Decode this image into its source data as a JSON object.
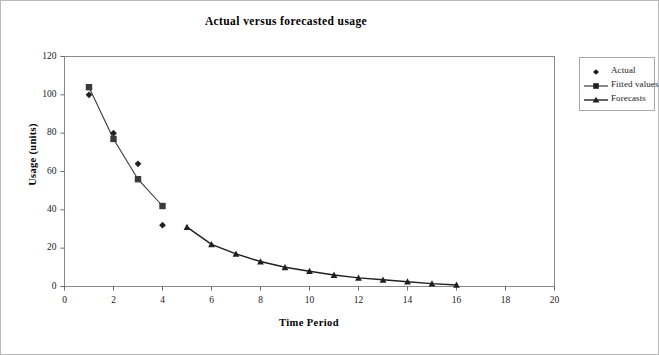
{
  "figure": {
    "border_color": "#b9b9b9",
    "background": "#ffffff"
  },
  "chart_data": {
    "type": "line",
    "title": "Actual versus forecasted usage",
    "xlabel": "Time Period",
    "ylabel": "Usage (units)",
    "xlim": [
      0,
      20
    ],
    "ylim": [
      0,
      120
    ],
    "xticks": [
      0,
      2,
      4,
      6,
      8,
      10,
      12,
      14,
      16,
      18,
      20
    ],
    "yticks": [
      0,
      20,
      40,
      60,
      80,
      100,
      120
    ],
    "grid": false,
    "legend_position": "right-outside",
    "series": [
      {
        "name": "Actual",
        "marker": "diamond",
        "line": false,
        "color": "#202020",
        "x": [
          1,
          2,
          3,
          4
        ],
        "values": [
          100,
          80,
          64,
          32
        ]
      },
      {
        "name": "Fitted values",
        "marker": "square",
        "line": true,
        "color": "#3a3a3a",
        "x": [
          1,
          2,
          3,
          4
        ],
        "values": [
          104,
          77,
          56,
          42
        ]
      },
      {
        "name": "Forecasts",
        "marker": "triangle",
        "line": true,
        "color": "#202020",
        "x": [
          5,
          6,
          7,
          8,
          9,
          10,
          11,
          12,
          13,
          14,
          15,
          16
        ],
        "values": [
          31,
          22,
          17,
          13,
          10,
          8,
          6,
          4.5,
          3.5,
          2.5,
          1.5,
          0.8
        ]
      }
    ]
  },
  "legend": {
    "items": [
      {
        "label": "Actual",
        "key": "diamond-marker"
      },
      {
        "label": "Fitted values",
        "key": "square-line-marker"
      },
      {
        "label": "Forecasts",
        "key": "triangle-line-marker"
      }
    ]
  }
}
